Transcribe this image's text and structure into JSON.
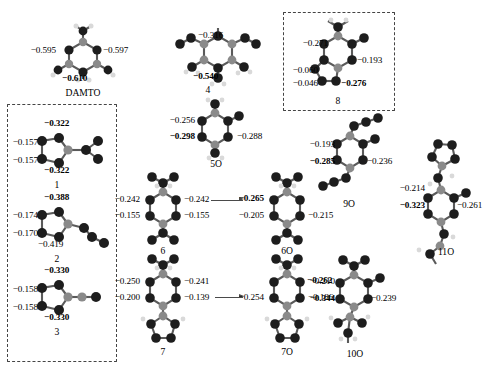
{
  "figure": {
    "type": "molecular-structure-diagram",
    "atom_colors": {
      "carbon_dark": "#1d1d1d",
      "nitrogen_gray": "#8a8a8a",
      "hydrogen_light": "#d9d9d9",
      "bond": "#5a5a5a",
      "box_dash": "#444444",
      "arrow": "#4a4a4a"
    }
  },
  "structures": [
    {
      "id": "damto",
      "label": "DAMTO",
      "boxed": false,
      "charges": [
        {
          "key": "left",
          "text": "−0.595",
          "bold": false
        },
        {
          "key": "right",
          "text": "−0.597",
          "bold": false
        },
        {
          "key": "bottom",
          "text": "−0.610",
          "bold": true
        }
      ]
    },
    {
      "id": "s1",
      "label": "1",
      "boxed": true,
      "charges": [
        {
          "key": "top",
          "text": "−0.322",
          "bold": true
        },
        {
          "key": "left-upper",
          "text": "−0.157",
          "bold": false
        },
        {
          "key": "left-lower",
          "text": "−0.157",
          "bold": false
        },
        {
          "key": "bottom",
          "text": "−0.322",
          "bold": true
        }
      ]
    },
    {
      "id": "s2",
      "label": "2",
      "boxed": true,
      "charges": [
        {
          "key": "top",
          "text": "−0.388",
          "bold": true
        },
        {
          "key": "left-upper",
          "text": "−0.174",
          "bold": false
        },
        {
          "key": "left-lower",
          "text": "−0.170",
          "bold": false
        },
        {
          "key": "bottom",
          "text": "−0.419",
          "bold": false
        }
      ]
    },
    {
      "id": "s3",
      "label": "3",
      "boxed": true,
      "charges": [
        {
          "key": "top",
          "text": "−0.330",
          "bold": true
        },
        {
          "key": "left-upper",
          "text": "−0.158",
          "bold": false
        },
        {
          "key": "left-lower",
          "text": "−0.158",
          "bold": false
        },
        {
          "key": "bottom",
          "text": "−0.330",
          "bold": true
        }
      ]
    },
    {
      "id": "s4",
      "label": "4",
      "boxed": false,
      "charges": [
        {
          "key": "top",
          "text": "−0.316",
          "bold": false
        },
        {
          "key": "bottom",
          "text": "−0.540",
          "bold": true
        }
      ]
    },
    {
      "id": "s5o",
      "label": "5O",
      "boxed": false,
      "charges": [
        {
          "key": "left-upper",
          "text": "−0.256",
          "bold": false
        },
        {
          "key": "left-lower",
          "text": "−0.298",
          "bold": true
        },
        {
          "key": "right",
          "text": "−0.288",
          "bold": false
        }
      ]
    },
    {
      "id": "s6",
      "label": "6",
      "boxed": false,
      "charges": [
        {
          "key": "left-upper",
          "text": "−0.242",
          "bold": false
        },
        {
          "key": "left-lower",
          "text": "−0.155",
          "bold": false
        },
        {
          "key": "right-upper",
          "text": "−0.242",
          "bold": false
        },
        {
          "key": "right-lower",
          "text": "−0.155",
          "bold": false
        }
      ]
    },
    {
      "id": "s6o",
      "label": "6O",
      "boxed": false,
      "charges": [
        {
          "key": "left-upper",
          "text": "−0.265",
          "bold": true
        },
        {
          "key": "left-lower",
          "text": "−0.205",
          "bold": false
        },
        {
          "key": "right-lower",
          "text": "−0.215",
          "bold": false
        }
      ]
    },
    {
      "id": "s7",
      "label": "7",
      "boxed": false,
      "charges": [
        {
          "key": "left-upper",
          "text": "−0.250",
          "bold": false
        },
        {
          "key": "left-lower",
          "text": "−0.200",
          "bold": false
        },
        {
          "key": "right-upper",
          "text": "−0.241",
          "bold": false
        },
        {
          "key": "right-lower",
          "text": "−0.139",
          "bold": false
        }
      ]
    },
    {
      "id": "s7o",
      "label": "7O",
      "boxed": false,
      "charges": [
        {
          "key": "left",
          "text": "−0.254",
          "bold": false
        },
        {
          "key": "right-upper",
          "text": "−0.262",
          "bold": true
        },
        {
          "key": "right-lower",
          "text": "−0.186",
          "bold": false
        }
      ]
    },
    {
      "id": "s8",
      "label": "8",
      "boxed": true,
      "charges": [
        {
          "key": "left-upper",
          "text": "−0.271",
          "bold": false
        },
        {
          "key": "right",
          "text": "−0.193",
          "bold": false
        },
        {
          "key": "left-mid",
          "text": "−0.060",
          "bold": false
        },
        {
          "key": "left-lower",
          "text": "−0.046",
          "bold": false
        },
        {
          "key": "bottom",
          "text": "−0.276",
          "bold": true
        }
      ]
    },
    {
      "id": "s9o",
      "label": "9O",
      "boxed": false,
      "charges": [
        {
          "key": "left-upper",
          "text": "−0.193",
          "bold": false
        },
        {
          "key": "left-lower",
          "text": "−0.285",
          "bold": true
        },
        {
          "key": "right",
          "text": "−0.236",
          "bold": false
        }
      ]
    },
    {
      "id": "s10o",
      "label": "10O",
      "boxed": false,
      "charges": [
        {
          "key": "left-upper",
          "text": "−0.210",
          "bold": false
        },
        {
          "key": "left-lower",
          "text": "−0.344",
          "bold": true
        },
        {
          "key": "right",
          "text": "−0.239",
          "bold": false
        }
      ]
    },
    {
      "id": "s11o",
      "label": "11O",
      "boxed": false,
      "charges": [
        {
          "key": "left-upper",
          "text": "−0.214",
          "bold": false
        },
        {
          "key": "left-lower",
          "text": "−0.323",
          "bold": true
        },
        {
          "key": "right",
          "text": "−0.261",
          "bold": false
        }
      ]
    }
  ]
}
